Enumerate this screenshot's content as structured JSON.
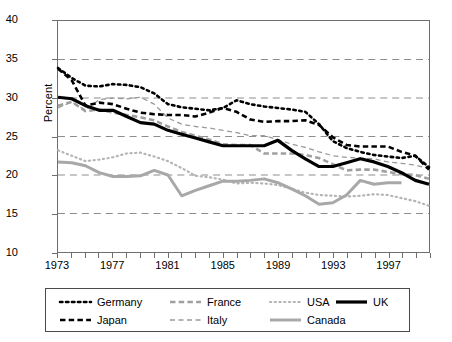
{
  "chart_data": {
    "type": "line",
    "title": "",
    "xlabel": "",
    "ylabel": "Percent",
    "xlim": [
      1973,
      2000
    ],
    "ylim": [
      10,
      40
    ],
    "yticks": [
      10,
      15,
      20,
      25,
      30,
      35,
      40
    ],
    "xticks": [
      1973,
      1977,
      1981,
      1985,
      1989,
      1993,
      1997
    ],
    "x_tick_step": 1,
    "x_label_step": 4,
    "grid": "horizontal-dashed",
    "legend_position": "below",
    "x": [
      1973,
      1974,
      1975,
      1976,
      1977,
      1978,
      1979,
      1980,
      1981,
      1982,
      1983,
      1984,
      1985,
      1986,
      1987,
      1988,
      1989,
      1990,
      1991,
      1992,
      1993,
      1994,
      1995,
      1996,
      1997,
      1998,
      1999,
      2000
    ],
    "series": [
      {
        "name": "Germany",
        "style": "dotted",
        "color": "#000000",
        "width": 2.6,
        "values": [
          33.9,
          32.6,
          31.6,
          31.5,
          31.8,
          31.7,
          31.4,
          30.6,
          29.2,
          28.8,
          28.6,
          28.4,
          28.7,
          29.7,
          29.2,
          28.9,
          28.7,
          28.5,
          28.2,
          26.6,
          24.4,
          23.5,
          23.0,
          22.6,
          22.4,
          22.2,
          22.5,
          21.0
        ]
      },
      {
        "name": "Japan",
        "style": "dashed",
        "color": "#000000",
        "width": 2.6,
        "values": [
          33.8,
          32.3,
          29.0,
          29.4,
          29.2,
          28.6,
          28.1,
          27.9,
          27.8,
          27.8,
          27.6,
          28.1,
          28.7,
          28.2,
          27.2,
          26.9,
          27.0,
          27.0,
          27.1,
          26.5,
          24.9,
          23.9,
          23.7,
          23.7,
          23.7,
          23.0,
          22.5,
          20.7
        ]
      },
      {
        "name": "France",
        "style": "dashed",
        "color": "#a0a0a0",
        "width": 2.6,
        "values": [
          29.0,
          29.5,
          28.3,
          28.5,
          28.1,
          27.8,
          27.5,
          27.1,
          26.3,
          25.6,
          25.1,
          24.6,
          24.0,
          23.9,
          23.9,
          22.8,
          22.8,
          22.8,
          22.6,
          22.2,
          21.4,
          20.6,
          20.7,
          20.7,
          20.4,
          20.1,
          20.0,
          19.5
        ]
      },
      {
        "name": "Italy",
        "style": "dashed-thin",
        "color": "#9a9a9a",
        "width": 1.3,
        "values": [
          28.7,
          29.5,
          28.4,
          29.8,
          30.0,
          29.9,
          30.1,
          29.2,
          27.4,
          26.6,
          26.3,
          26.1,
          25.8,
          25.5,
          25.1,
          25.1,
          24.6,
          24.0,
          23.6,
          23.0,
          22.5,
          22.3,
          22.2,
          22.1,
          21.7,
          21.5,
          21.3,
          20.8
        ]
      },
      {
        "name": "USA",
        "style": "fine-dotted",
        "color": "#b4b4b4",
        "width": 2.2,
        "values": [
          23.2,
          22.5,
          21.8,
          22.0,
          22.3,
          22.8,
          22.9,
          22.4,
          21.8,
          20.9,
          19.9,
          19.7,
          19.4,
          18.9,
          19.0,
          18.9,
          18.7,
          18.2,
          17.7,
          17.4,
          17.3,
          17.2,
          17.3,
          17.5,
          17.4,
          17.0,
          16.6,
          16.0
        ]
      },
      {
        "name": "UK",
        "style": "solid",
        "color": "#000000",
        "width": 3.2,
        "values": [
          30.1,
          29.9,
          29.0,
          28.4,
          28.4,
          27.6,
          26.8,
          26.6,
          25.8,
          25.3,
          24.8,
          24.3,
          23.8,
          23.8,
          23.8,
          23.8,
          24.5,
          23.2,
          22.1,
          21.1,
          21.1,
          21.6,
          22.1,
          21.7,
          21.1,
          20.3,
          19.3,
          18.8
        ]
      },
      {
        "name": "Canada",
        "style": "solid",
        "color": "#a8a8a8",
        "width": 3.0,
        "values": [
          21.7,
          21.6,
          21.2,
          20.3,
          19.8,
          19.8,
          19.9,
          20.6,
          20.0,
          17.3,
          18.0,
          18.6,
          19.2,
          19.2,
          19.3,
          19.5,
          19.0,
          18.2,
          17.3,
          16.2,
          16.4,
          17.4,
          19.3,
          18.8,
          19.0,
          19.0,
          null,
          null
        ]
      }
    ]
  },
  "legend": {
    "items": [
      {
        "label": "Germany",
        "series": 0,
        "row": 0,
        "col": 0
      },
      {
        "label": "France",
        "series": 2,
        "row": 0,
        "col": 1
      },
      {
        "label": "USA",
        "series": 4,
        "row": 0,
        "col": 2
      },
      {
        "label": "UK",
        "series": 5,
        "row": 0,
        "col": 3
      },
      {
        "label": "Japan",
        "series": 1,
        "row": 1,
        "col": 0
      },
      {
        "label": "Italy",
        "series": 3,
        "row": 1,
        "col": 1
      },
      {
        "label": "Canada",
        "series": 6,
        "row": 1,
        "col": 2
      }
    ]
  }
}
